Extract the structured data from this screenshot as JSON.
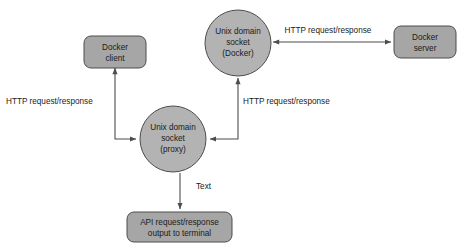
{
  "diagram": {
    "background_color": "#ffffff",
    "shape_fill_box": "#a6a6a6",
    "shape_fill_circle": "#b3b3b3",
    "shape_stroke": "#4d4d4d",
    "text_color": "#1a1a1a",
    "nodes": [
      {
        "id": "docker-client",
        "shape": "rounded-rect",
        "lines": [
          "Docker",
          "client"
        ],
        "x": 84,
        "y": 36,
        "width": 62,
        "height": 32
      },
      {
        "id": "unix-socket-docker",
        "shape": "circle",
        "lines": [
          "Unix domain",
          "socket",
          "(Docker)"
        ],
        "cx": 238,
        "cy": 43,
        "r": 33
      },
      {
        "id": "docker-server",
        "shape": "rounded-rect",
        "lines": [
          "Docker",
          "server"
        ],
        "x": 394,
        "y": 26,
        "width": 62,
        "height": 32
      },
      {
        "id": "unix-socket-proxy",
        "shape": "circle",
        "lines": [
          "Unix domain",
          "socket",
          "(proxy)"
        ],
        "cx": 173,
        "cy": 139,
        "r": 33
      },
      {
        "id": "api-output",
        "shape": "rounded-rect",
        "lines": [
          "API request/response",
          "output to terminal"
        ],
        "x": 127,
        "y": 212,
        "width": 105,
        "height": 30
      }
    ],
    "edges": [
      {
        "id": "edge-proxy-client",
        "from": "unix-socket-proxy",
        "to": "docker-client",
        "label": "HTTP request/response",
        "label_x": 6,
        "label_y": 102,
        "label_anchor": "start",
        "arrowheads": "both"
      },
      {
        "id": "edge-proxy-docker-socket",
        "from": "unix-socket-proxy",
        "to": "unix-socket-docker",
        "label": "HTTP request/response",
        "label_x": 243,
        "label_y": 102,
        "label_anchor": "start",
        "arrowheads": "both"
      },
      {
        "id": "edge-docker-socket-server",
        "from": "unix-socket-docker",
        "to": "docker-server",
        "label": "HTTP request/response",
        "label_x": 328,
        "label_y": 31,
        "label_anchor": "middle",
        "arrowheads": "both"
      },
      {
        "id": "edge-proxy-terminal",
        "from": "unix-socket-proxy",
        "to": "api-output",
        "label": "Text",
        "label_x": 196,
        "label_y": 187,
        "label_anchor": "start",
        "arrowheads": "end"
      }
    ]
  }
}
